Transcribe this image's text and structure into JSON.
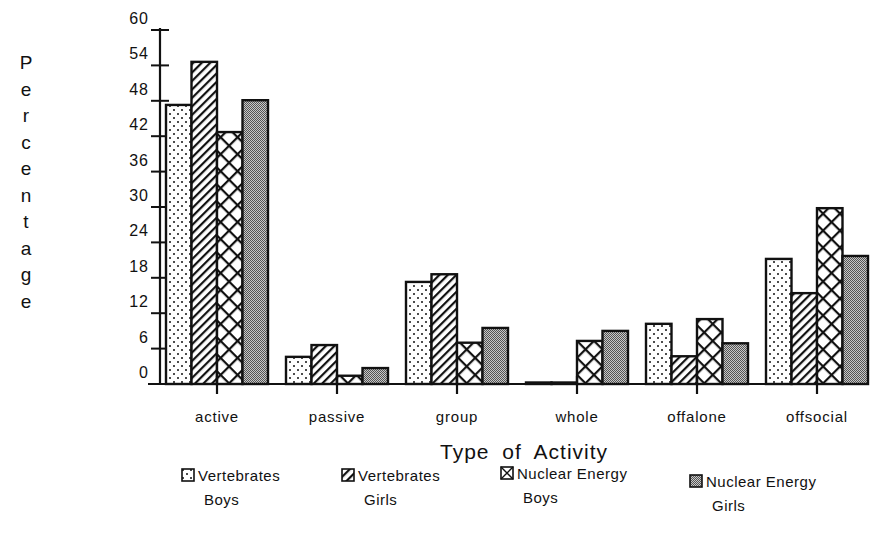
{
  "chart_data": {
    "type": "bar",
    "title": "",
    "xlabel": "Type of Activity",
    "ylabel": "Percentage",
    "ylim": [
      0,
      60
    ],
    "yticks": [
      0,
      6,
      12,
      18,
      24,
      30,
      36,
      42,
      48,
      54,
      60
    ],
    "grid": false,
    "legend_position": "bottom",
    "categories": [
      "active",
      "passive",
      "group",
      "whole",
      "offalone",
      "offsocial"
    ],
    "series": [
      {
        "name": "Vertebrates Boys",
        "pattern": "dots",
        "values": [
          47.3,
          4.6,
          17.3,
          0,
          10.2,
          21.2
        ]
      },
      {
        "name": "Vertebrates Girls",
        "pattern": "diagonal-hatch",
        "values": [
          54.6,
          6.6,
          18.6,
          0,
          4.7,
          15.4
        ]
      },
      {
        "name": "Nuclear Energy Boys",
        "pattern": "crosshatch",
        "values": [
          42.7,
          1.4,
          7.0,
          7.3,
          11.0,
          29.8
        ]
      },
      {
        "name": "Nuclear Energy Girls",
        "pattern": "fine-stipple",
        "values": [
          48.1,
          2.7,
          9.5,
          9.0,
          6.9,
          21.7
        ]
      }
    ]
  },
  "axis": {
    "ylabel_letters": [
      "P",
      "e",
      "r",
      "c",
      "e",
      "n",
      "t",
      "a",
      "g",
      "e"
    ],
    "xlabel": "Type of Activity"
  },
  "legend": {
    "items": [
      {
        "line1": "Vertebrates",
        "line2": "Boys"
      },
      {
        "line1": "Vertebrates",
        "line2": "Girls"
      },
      {
        "line1": "Nuclear Energy",
        "line2": "Boys"
      },
      {
        "line1": "Nuclear Energy",
        "line2": "Girls"
      }
    ]
  },
  "colors": {
    "ink": "#111111",
    "background": "#ffffff",
    "stipple": "#9a9a9a"
  }
}
